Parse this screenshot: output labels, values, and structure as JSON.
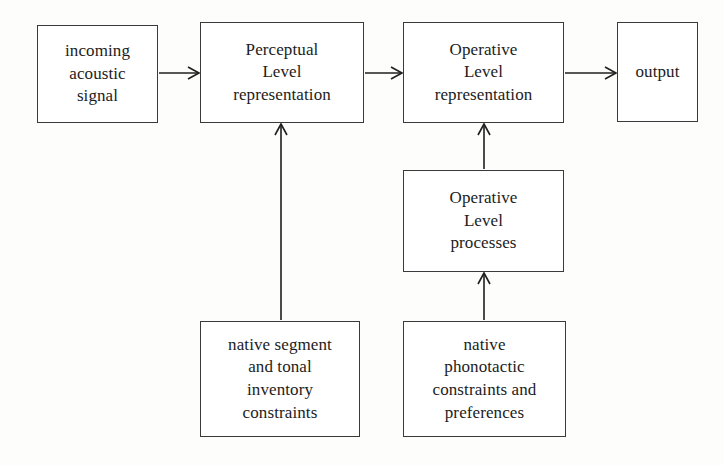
{
  "diagram": {
    "background_color": "#fdfdfc",
    "stroke_color": "#1f1f1f",
    "border_color": "#3a3a3a",
    "nodes": [
      {
        "id": "incoming-acoustic-signal",
        "label": "incoming\nacoustic\nsignal",
        "x": 37,
        "y": 25,
        "w": 121,
        "h": 98
      },
      {
        "id": "perceptual-level-representation",
        "label": "Perceptual\nLevel\nrepresentation",
        "x": 200,
        "y": 22,
        "w": 164,
        "h": 101
      },
      {
        "id": "operative-level-representation",
        "label": "Operative\nLevel\nrepresentation",
        "x": 403,
        "y": 22,
        "w": 161,
        "h": 101
      },
      {
        "id": "output",
        "label": "output",
        "x": 617,
        "y": 22,
        "w": 81,
        "h": 100
      },
      {
        "id": "operative-level-processes",
        "label": "Operative\nLevel\nprocesses",
        "x": 403,
        "y": 170,
        "w": 161,
        "h": 102
      },
      {
        "id": "native-segment-and-tonal-inventory-constraints",
        "label": "native segment\nand tonal\ninventory\nconstraints",
        "x": 200,
        "y": 321,
        "w": 160,
        "h": 116
      },
      {
        "id": "native-phonotactic-constraints-and-preferences",
        "label": "native\nphonotactic\nconstraints and\npreferences",
        "x": 403,
        "y": 321,
        "w": 163,
        "h": 116
      }
    ],
    "edges": [
      {
        "id": "signal-to-perceptual",
        "from": "incoming-acoustic-signal",
        "to": "perceptual-level-representation",
        "direction": "right",
        "x1": 159,
        "y1": 73,
        "x2": 199,
        "y2": 73
      },
      {
        "id": "perceptual-to-operative",
        "from": "perceptual-level-representation",
        "to": "operative-level-representation",
        "direction": "right",
        "x1": 365,
        "y1": 73,
        "x2": 402,
        "y2": 73
      },
      {
        "id": "operative-to-output",
        "from": "operative-level-representation",
        "to": "output",
        "direction": "right",
        "x1": 565,
        "y1": 73,
        "x2": 616,
        "y2": 73
      },
      {
        "id": "inventory-to-perceptual",
        "from": "native-segment-and-tonal-inventory-constraints",
        "to": "perceptual-level-representation",
        "direction": "up",
        "x1": 281,
        "y1": 320,
        "x2": 281,
        "y2": 124
      },
      {
        "id": "processes-to-operative-representation",
        "from": "operative-level-processes",
        "to": "operative-level-representation",
        "direction": "up",
        "x1": 484,
        "y1": 169,
        "x2": 484,
        "y2": 124
      },
      {
        "id": "phonotactic-to-processes",
        "from": "native-phonotactic-constraints-and-preferences",
        "to": "operative-level-processes",
        "direction": "up",
        "x1": 484,
        "y1": 320,
        "x2": 484,
        "y2": 273
      }
    ]
  }
}
